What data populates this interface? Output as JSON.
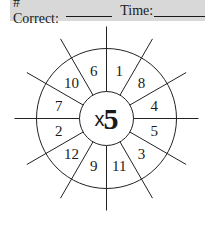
{
  "header": {
    "correct_label": "# Correct:",
    "time_label": "Time:",
    "background": "#d8d8d8"
  },
  "wheel": {
    "operator": "x",
    "multiplier": "5",
    "center": [
      106.5,
      118.5
    ],
    "inner_radius": 27,
    "outer_radius": 70,
    "spoke_length": 92,
    "spoke_count": 12,
    "numbers_clockwise_from_top": [
      "1",
      "8",
      "4",
      "5",
      "3",
      "11",
      "9",
      "12",
      "2",
      "7",
      "10",
      "6"
    ]
  }
}
